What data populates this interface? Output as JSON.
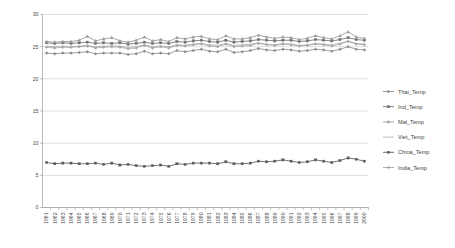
{
  "chart_data": {
    "type": "line",
    "title": "",
    "xlabel": "",
    "ylabel": "",
    "ylim": [
      0,
      30
    ],
    "ytick_values": [
      0,
      5,
      10,
      15,
      20,
      25,
      30
    ],
    "ytick_labels": [
      "0",
      "5",
      "10",
      "15",
      "20",
      "25",
      "30"
    ],
    "grid": true,
    "legend_position": "right",
    "x": [
      1961,
      1962,
      1963,
      1964,
      1965,
      1966,
      1967,
      1968,
      1969,
      1970,
      1971,
      1972,
      1973,
      1974,
      1975,
      1976,
      1977,
      1978,
      1979,
      1980,
      1981,
      1982,
      1983,
      1984,
      1985,
      1986,
      1987,
      1988,
      1989,
      1990,
      1991,
      1992,
      1993,
      1994,
      1995,
      1996,
      1997,
      1998,
      1999,
      2000
    ],
    "xtick_labels": [
      "1961",
      "1962",
      "1963",
      "1964",
      "1965",
      "1966",
      "1967",
      "1968",
      "1969",
      "1970",
      "1971",
      "1972",
      "1973",
      "1974",
      "1975",
      "1976",
      "1977",
      "1978",
      "1979",
      "1980",
      "1981",
      "1982",
      "1983",
      "1984",
      "1985",
      "1986",
      "1987",
      "1988",
      "1989",
      "1990",
      "1991",
      "1992",
      "1993",
      "1994",
      "1995",
      "1996",
      "1997",
      "1998",
      "1999",
      "2000"
    ],
    "series": [
      {
        "name": "Thai_Temp",
        "color": "#8c8c8c",
        "marker": "diamond",
        "values": [
          24.0,
          23.9,
          24.0,
          24.0,
          24.1,
          24.2,
          23.9,
          24.0,
          24.0,
          24.0,
          23.8,
          23.9,
          24.3,
          23.9,
          24.0,
          23.9,
          24.4,
          24.2,
          24.4,
          24.6,
          24.3,
          24.2,
          24.6,
          24.1,
          24.2,
          24.4,
          24.7,
          24.5,
          24.4,
          24.6,
          24.5,
          24.3,
          24.4,
          24.6,
          24.5,
          24.3,
          24.6,
          25.0,
          24.6,
          24.5
        ]
      },
      {
        "name": "Ind_Temp",
        "color": "#6e6e6e",
        "marker": "square",
        "values": [
          25.6,
          25.5,
          25.6,
          25.5,
          25.6,
          25.7,
          25.5,
          25.6,
          25.5,
          25.6,
          25.4,
          25.5,
          25.7,
          25.5,
          25.6,
          25.5,
          25.8,
          25.7,
          25.9,
          26.0,
          25.8,
          25.7,
          26.0,
          25.7,
          25.8,
          25.9,
          26.1,
          26.0,
          25.9,
          26.0,
          26.0,
          25.8,
          25.9,
          26.1,
          26.0,
          25.9,
          26.1,
          26.4,
          26.1,
          26.0
        ]
      },
      {
        "name": "Mal_Temp",
        "color": "#9a9a9a",
        "marker": "triangle",
        "values": [
          25.8,
          25.7,
          25.8,
          25.8,
          26.0,
          26.6,
          25.9,
          26.2,
          26.4,
          25.9,
          25.7,
          26.0,
          26.5,
          25.9,
          26.1,
          25.8,
          26.4,
          26.2,
          26.5,
          26.6,
          26.2,
          26.1,
          26.7,
          26.2,
          26.2,
          26.4,
          26.8,
          26.5,
          26.3,
          26.5,
          26.4,
          26.1,
          26.3,
          26.7,
          26.4,
          26.2,
          26.7,
          27.3,
          26.5,
          26.3
        ]
      },
      {
        "name": "Viet_Temp",
        "color": "#b4b4b4",
        "marker": "none",
        "values": [
          25.1,
          25.0,
          25.1,
          25.0,
          25.1,
          25.2,
          25.0,
          25.1,
          25.1,
          25.1,
          24.9,
          25.0,
          25.3,
          25.0,
          25.1,
          25.0,
          25.3,
          25.2,
          25.4,
          25.5,
          25.3,
          25.2,
          25.5,
          25.2,
          25.3,
          25.4,
          25.6,
          25.4,
          25.3,
          25.5,
          25.4,
          25.2,
          25.3,
          25.5,
          25.4,
          25.3,
          25.5,
          25.9,
          25.5,
          25.4
        ]
      },
      {
        "name": "China_Temp",
        "color": "#5a5a5a",
        "marker": "square",
        "values": [
          7.0,
          6.8,
          6.9,
          6.9,
          6.8,
          6.8,
          6.9,
          6.7,
          6.9,
          6.6,
          6.7,
          6.5,
          6.4,
          6.5,
          6.6,
          6.4,
          6.8,
          6.7,
          6.9,
          6.9,
          6.9,
          6.8,
          7.1,
          6.8,
          6.8,
          6.9,
          7.2,
          7.1,
          7.2,
          7.4,
          7.2,
          7.0,
          7.1,
          7.4,
          7.2,
          7.0,
          7.3,
          7.7,
          7.5,
          7.2
        ]
      },
      {
        "name": "India_Temp",
        "color": "#a5a5a5",
        "marker": "diamond",
        "values": [
          24.9,
          24.8,
          24.9,
          24.9,
          25.0,
          25.1,
          24.8,
          24.9,
          25.0,
          24.9,
          24.7,
          24.8,
          25.2,
          24.8,
          25.0,
          24.8,
          25.2,
          25.1,
          25.3,
          25.4,
          25.1,
          25.0,
          25.4,
          25.0,
          25.1,
          25.2,
          25.5,
          25.3,
          25.2,
          25.4,
          25.3,
          25.1,
          25.2,
          25.4,
          25.3,
          25.1,
          25.4,
          25.8,
          25.4,
          25.3
        ]
      }
    ]
  },
  "legend": {
    "items": [
      {
        "label": "Thai_Temp"
      },
      {
        "label": "Ind_Temp"
      },
      {
        "label": "Mal_Temp"
      },
      {
        "label": "Viet_Temp"
      },
      {
        "label": "China_Temp"
      },
      {
        "label": "India_Temp"
      }
    ]
  }
}
